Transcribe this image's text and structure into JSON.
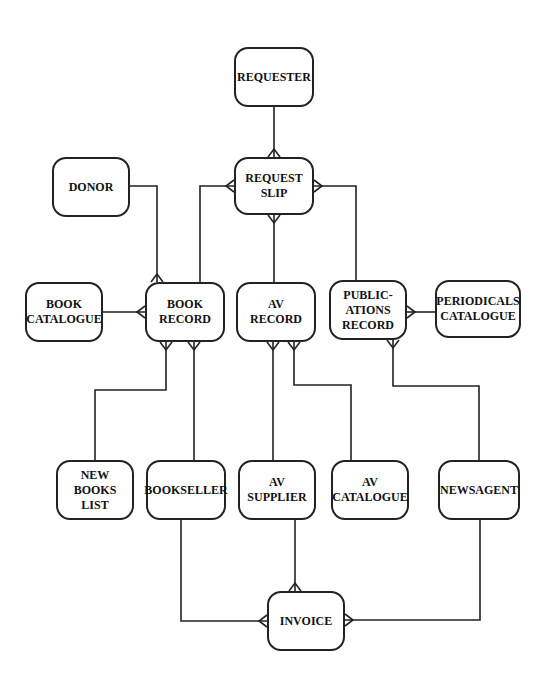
{
  "diagram": {
    "type": "entity-relationship",
    "entities": [
      {
        "id": "requester",
        "lines": [
          "REQUESTER"
        ],
        "x": 234,
        "y": 47,
        "w": 80,
        "h": 60
      },
      {
        "id": "request_slip",
        "lines": [
          "REQUEST",
          "SLIP"
        ],
        "x": 234,
        "y": 157,
        "w": 80,
        "h": 58
      },
      {
        "id": "donor",
        "lines": [
          "DONOR"
        ],
        "x": 52,
        "y": 157,
        "w": 78,
        "h": 60
      },
      {
        "id": "book_catalogue",
        "lines": [
          "BOOK",
          "CATALOGUE"
        ],
        "x": 25,
        "y": 282,
        "w": 78,
        "h": 60
      },
      {
        "id": "book_record",
        "lines": [
          "BOOK",
          "RECORD"
        ],
        "x": 145,
        "y": 282,
        "w": 80,
        "h": 60
      },
      {
        "id": "av_record",
        "lines": [
          "AV",
          "RECORD"
        ],
        "x": 236,
        "y": 282,
        "w": 80,
        "h": 60
      },
      {
        "id": "publications_record",
        "lines": [
          "PUBLIC-",
          "ATIONS",
          "RECORD"
        ],
        "x": 329,
        "y": 280,
        "w": 78,
        "h": 60
      },
      {
        "id": "periodicals_catalogue",
        "lines": [
          "PERIODICALS",
          "CATALOGUE"
        ],
        "x": 435,
        "y": 280,
        "w": 86,
        "h": 58
      },
      {
        "id": "new_books_list",
        "lines": [
          "NEW",
          "BOOKS",
          "LIST"
        ],
        "x": 56,
        "y": 460,
        "w": 78,
        "h": 60
      },
      {
        "id": "bookseller",
        "lines": [
          "BOOKSELLER"
        ],
        "x": 146,
        "y": 460,
        "w": 80,
        "h": 60
      },
      {
        "id": "av_supplier",
        "lines": [
          "AV",
          "SUPPLIER"
        ],
        "x": 238,
        "y": 460,
        "w": 78,
        "h": 60
      },
      {
        "id": "av_catalogue",
        "lines": [
          "AV",
          "CATALOGUE"
        ],
        "x": 331,
        "y": 460,
        "w": 78,
        "h": 60
      },
      {
        "id": "newsagent",
        "lines": [
          "NEWSAGENT"
        ],
        "x": 438,
        "y": 460,
        "w": 82,
        "h": 60
      },
      {
        "id": "invoice",
        "lines": [
          "INVOICE"
        ],
        "x": 267,
        "y": 591,
        "w": 78,
        "h": 60
      }
    ],
    "relationships": [
      {
        "from": "requester",
        "to": "request_slip",
        "cardinality": "one-to-many",
        "path": [
          [
            274,
            107
          ],
          [
            274,
            157
          ]
        ],
        "crowfoot": {
          "at": [
            274,
            157
          ],
          "dir": "down"
        }
      },
      {
        "from": "request_slip",
        "to": "book_record",
        "cardinality": "one-to-many",
        "path": [
          [
            234,
            186
          ],
          [
            200,
            186
          ],
          [
            200,
            282
          ]
        ],
        "crowfoot": {
          "at": [
            234,
            186
          ],
          "dir": "right"
        }
      },
      {
        "from": "request_slip",
        "to": "av_record",
        "cardinality": "one-to-many",
        "path": [
          [
            274,
            215
          ],
          [
            274,
            282
          ]
        ],
        "crowfoot": {
          "at": [
            274,
            215
          ],
          "dir": "up"
        }
      },
      {
        "from": "request_slip",
        "to": "publications_record",
        "cardinality": "one-to-many",
        "path": [
          [
            314,
            186
          ],
          [
            356,
            186
          ],
          [
            356,
            280
          ]
        ],
        "crowfoot": {
          "at": [
            314,
            186
          ],
          "dir": "left"
        }
      },
      {
        "from": "donor",
        "to": "book_record",
        "cardinality": "one-to-many",
        "path": [
          [
            130,
            186
          ],
          [
            157,
            186
          ],
          [
            157,
            282
          ]
        ],
        "crowfoot": {
          "at": [
            157,
            282
          ],
          "dir": "down"
        }
      },
      {
        "from": "book_catalogue",
        "to": "book_record",
        "cardinality": "one-to-many",
        "path": [
          [
            103,
            312
          ],
          [
            145,
            312
          ]
        ],
        "crowfoot": {
          "at": [
            145,
            312
          ],
          "dir": "right"
        }
      },
      {
        "from": "new_books_list",
        "to": "book_record",
        "cardinality": "one-to-many",
        "path": [
          [
            95,
            460
          ],
          [
            95,
            390
          ],
          [
            166,
            390
          ],
          [
            166,
            342
          ]
        ],
        "crowfoot": {
          "at": [
            166,
            342
          ],
          "dir": "up"
        }
      },
      {
        "from": "bookseller",
        "to": "book_record",
        "cardinality": "one-to-many",
        "path": [
          [
            194,
            460
          ],
          [
            194,
            342
          ]
        ],
        "crowfoot": {
          "at": [
            194,
            342
          ],
          "dir": "up"
        }
      },
      {
        "from": "av_supplier",
        "to": "av_record",
        "cardinality": "one-to-many",
        "path": [
          [
            273,
            460
          ],
          [
            273,
            342
          ]
        ],
        "crowfoot": {
          "at": [
            273,
            342
          ],
          "dir": "up"
        }
      },
      {
        "from": "av_catalogue",
        "to": "av_record",
        "cardinality": "one-to-many",
        "path": [
          [
            351,
            460
          ],
          [
            351,
            385
          ],
          [
            294,
            385
          ],
          [
            294,
            342
          ]
        ],
        "crowfoot": {
          "at": [
            294,
            342
          ],
          "dir": "up"
        }
      },
      {
        "from": "periodicals_catalogue",
        "to": "publications_record",
        "cardinality": "one-to-many",
        "path": [
          [
            435,
            312
          ],
          [
            407,
            312
          ]
        ],
        "crowfoot": {
          "at": [
            407,
            312
          ],
          "dir": "left"
        }
      },
      {
        "from": "newsagent",
        "to": "publications_record",
        "cardinality": "one-to-many",
        "path": [
          [
            479,
            460
          ],
          [
            479,
            386
          ],
          [
            393,
            386
          ],
          [
            393,
            340
          ]
        ],
        "crowfoot": {
          "at": [
            393,
            340
          ],
          "dir": "up"
        }
      },
      {
        "from": "bookseller",
        "to": "invoice",
        "cardinality": "one-to-many",
        "path": [
          [
            181,
            520
          ],
          [
            181,
            621
          ],
          [
            267,
            621
          ]
        ],
        "crowfoot": {
          "at": [
            267,
            621
          ],
          "dir": "right"
        }
      },
      {
        "from": "av_supplier",
        "to": "invoice",
        "cardinality": "one-to-many",
        "path": [
          [
            295,
            520
          ],
          [
            295,
            591
          ]
        ],
        "crowfoot": {
          "at": [
            295,
            591
          ],
          "dir": "down"
        }
      },
      {
        "from": "newsagent",
        "to": "invoice",
        "cardinality": "one-to-many",
        "path": [
          [
            480,
            520
          ],
          [
            480,
            620
          ],
          [
            345,
            620
          ]
        ],
        "crowfoot": {
          "at": [
            345,
            620
          ],
          "dir": "left"
        }
      }
    ]
  }
}
